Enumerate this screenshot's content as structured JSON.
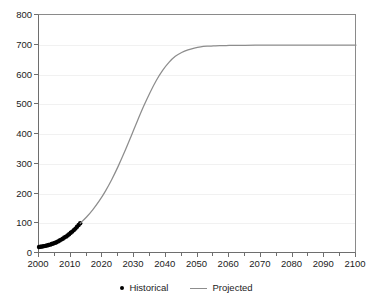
{
  "chart_data": {
    "type": "line",
    "title": "",
    "subtitle": "",
    "xlabel": "",
    "ylabel": "",
    "xlim": [
      2000,
      2100
    ],
    "ylim": [
      0,
      800
    ],
    "grid": "horizontal",
    "legend_position": "bottom",
    "y_ticks": [
      0,
      100,
      200,
      300,
      400,
      500,
      600,
      700,
      800
    ],
    "y_tick_labels": [
      "0",
      "100",
      "200",
      "300",
      "400",
      "500",
      "600",
      "700",
      "800"
    ],
    "x_ticks": [
      2000,
      2010,
      2020,
      2030,
      2040,
      2050,
      2060,
      2070,
      2080,
      2090,
      2100
    ],
    "x_tick_labels": [
      "2000",
      "2010",
      "2020",
      "2030",
      "2040",
      "2050",
      "2060",
      "2070",
      "2080",
      "2090",
      "2100"
    ],
    "x_minor_tick_interval": 5,
    "colors": {
      "historical_marker": "#000000",
      "projected_line": "#8d8d8d",
      "axis": "#6e6e6e",
      "gridline": "#f1f1f1",
      "text": "#1c1c1c",
      "background": "#ffffff"
    },
    "series": [
      {
        "name": "Historical",
        "style": "scatter",
        "marker": "filled-circle",
        "color": "#000000",
        "x": [
          2000,
          2000.5,
          2001,
          2001.5,
          2002,
          2002.5,
          2003,
          2003.5,
          2004,
          2004.5,
          2005,
          2005.5,
          2006,
          2006.5,
          2007,
          2007.5,
          2008,
          2008.5,
          2009,
          2009.5,
          2010,
          2010.5,
          2011,
          2011.5,
          2012,
          2012.5,
          2013
        ],
        "values": [
          20,
          21,
          22,
          23,
          24,
          25,
          27,
          28,
          30,
          32,
          34,
          36,
          39,
          42,
          45,
          48,
          52,
          55,
          59,
          63,
          68,
          72,
          77,
          82,
          88,
          94,
          100
        ]
      },
      {
        "name": "Projected",
        "style": "line",
        "color": "#8d8d8d",
        "x": [
          2013,
          2015,
          2017,
          2019,
          2021,
          2023,
          2025,
          2027,
          2029,
          2031,
          2033,
          2035,
          2037,
          2039,
          2041,
          2043,
          2045,
          2047,
          2049,
          2051,
          2053,
          2055,
          2057,
          2059,
          2061,
          2063,
          2065,
          2070,
          2075,
          2080,
          2085,
          2090,
          2095,
          2100
        ],
        "values": [
          100,
          121,
          146,
          175,
          209,
          248,
          292,
          340,
          391,
          443,
          493,
          539,
          580,
          614,
          641,
          661,
          674,
          683,
          689,
          693,
          695,
          696,
          697,
          697,
          698,
          698,
          698,
          699,
          699,
          699,
          699,
          699,
          699,
          699
        ],
        "model": "logistic",
        "asymptote": 700,
        "inflection_year": 2033,
        "plateau_reached_year": 2060
      }
    ],
    "legend": [
      {
        "label": "Historical",
        "marker": "dot",
        "color": "#000000"
      },
      {
        "label": "Projected",
        "marker": "line",
        "color": "#8d8d8d"
      }
    ]
  }
}
